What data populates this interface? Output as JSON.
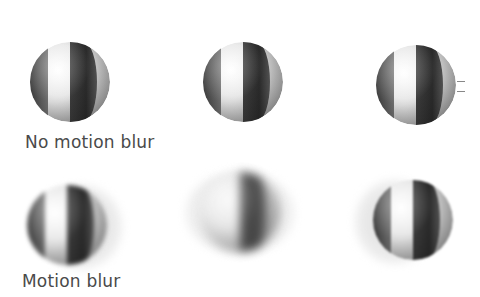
{
  "figure": {
    "rows": [
      {
        "label": "No motion blur",
        "balls": [
          {
            "position": "left",
            "blur": "none"
          },
          {
            "position": "middle",
            "blur": "none"
          },
          {
            "position": "right",
            "blur": "none"
          }
        ]
      },
      {
        "label": "Motion blur",
        "balls": [
          {
            "position": "left",
            "blur": "slight"
          },
          {
            "position": "middle",
            "blur": "heavy"
          },
          {
            "position": "right",
            "blur": "slight"
          }
        ]
      }
    ]
  },
  "colors": {
    "text": "#4a4a4a",
    "stripe_dark": "#2a2a2a",
    "background": "#ffffff"
  }
}
